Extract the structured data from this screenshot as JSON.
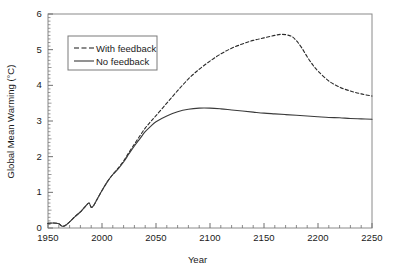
{
  "chart_data": {
    "type": "line",
    "title": "",
    "xlabel": "Year",
    "ylabel": "Global Mean Warming (°C)",
    "xlim": [
      1950,
      2250
    ],
    "ylim": [
      0,
      6
    ],
    "xticks": [
      1950,
      2000,
      2050,
      2100,
      2150,
      2200,
      2250
    ],
    "xtick_labels": [
      "1950",
      "2000",
      "2050",
      "2100",
      "2150",
      "2200",
      "2250"
    ],
    "yticks": [
      0,
      1,
      2,
      3,
      4,
      5,
      6
    ],
    "ytick_labels": [
      "0",
      "1",
      "2",
      "3",
      "4",
      "5",
      "6"
    ],
    "minor_ticks": true,
    "grid": false,
    "legend_position": "upper-left",
    "series": [
      {
        "name": "With feedback",
        "style": "dashed",
        "color": "#2b2b2b",
        "x": [
          1950,
          1955,
          1960,
          1963,
          1966,
          1970,
          1975,
          1980,
          1985,
          1988,
          1990,
          1992,
          1995,
          2000,
          2005,
          2010,
          2015,
          2020,
          2025,
          2030,
          2035,
          2040,
          2045,
          2050,
          2060,
          2070,
          2080,
          2090,
          2100,
          2110,
          2120,
          2130,
          2140,
          2150,
          2160,
          2167,
          2175,
          2180,
          2185,
          2190,
          2195,
          2200,
          2210,
          2220,
          2230,
          2240,
          2250
        ],
        "y": [
          0.13,
          0.14,
          0.12,
          0.05,
          0.07,
          0.17,
          0.32,
          0.45,
          0.62,
          0.7,
          0.58,
          0.62,
          0.78,
          1.05,
          1.3,
          1.5,
          1.68,
          1.88,
          2.12,
          2.35,
          2.58,
          2.8,
          2.98,
          3.15,
          3.5,
          3.85,
          4.18,
          4.45,
          4.68,
          4.88,
          5.04,
          5.16,
          5.26,
          5.33,
          5.4,
          5.43,
          5.38,
          5.25,
          5.05,
          4.8,
          4.58,
          4.4,
          4.12,
          3.95,
          3.84,
          3.76,
          3.7
        ]
      },
      {
        "name": "No feedback",
        "style": "solid",
        "color": "#3a3a3a",
        "x": [
          1950,
          1955,
          1960,
          1963,
          1966,
          1970,
          1975,
          1980,
          1985,
          1988,
          1990,
          1992,
          1995,
          2000,
          2005,
          2010,
          2015,
          2020,
          2025,
          2030,
          2035,
          2040,
          2045,
          2050,
          2060,
          2070,
          2080,
          2090,
          2100,
          2110,
          2120,
          2130,
          2140,
          2150,
          2160,
          2170,
          2180,
          2190,
          2200,
          2210,
          2220,
          2230,
          2240,
          2250
        ],
        "y": [
          0.13,
          0.14,
          0.12,
          0.05,
          0.07,
          0.17,
          0.32,
          0.45,
          0.62,
          0.7,
          0.58,
          0.62,
          0.78,
          1.05,
          1.3,
          1.5,
          1.66,
          1.85,
          2.08,
          2.3,
          2.5,
          2.7,
          2.85,
          2.98,
          3.14,
          3.26,
          3.33,
          3.36,
          3.36,
          3.34,
          3.31,
          3.28,
          3.25,
          3.22,
          3.2,
          3.18,
          3.16,
          3.14,
          3.12,
          3.1,
          3.09,
          3.07,
          3.06,
          3.05
        ]
      }
    ],
    "legend": [
      {
        "label": "With feedback",
        "style": "dashed"
      },
      {
        "label": "No feedback",
        "style": "solid"
      }
    ]
  },
  "axis": {
    "y_title": "Global Mean Warming (°C)",
    "x_title": "Year"
  },
  "legend": {
    "item1": "With feedback",
    "item2": "No feedback"
  },
  "ticks": {
    "x": [
      "1950",
      "2000",
      "2050",
      "2100",
      "2150",
      "2200",
      "2250"
    ],
    "y": [
      "0",
      "1",
      "2",
      "3",
      "4",
      "5",
      "6"
    ]
  },
  "caption_fragment": ""
}
